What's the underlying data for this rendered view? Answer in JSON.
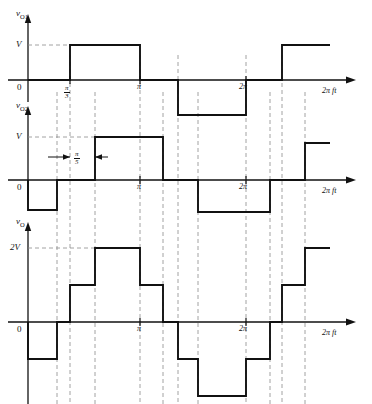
{
  "figure": {
    "stroke_color": "#111111",
    "dashed_color": "#808080",
    "background": "#ffffff",
    "axis_label": "2π ft",
    "zero_label": "0",
    "panels": [
      {
        "id": "vo1",
        "y_axis_label": "v",
        "y_axis_sub": "O1",
        "level_label": "V",
        "x_ticks": [
          {
            "label_type": "fraction",
            "num": "π",
            "den": "3",
            "x": 70
          },
          {
            "label_type": "plain",
            "label": "π",
            "x": 140
          },
          {
            "label_type": "plain",
            "label": "2π",
            "x": 246
          }
        ],
        "waveform": {
          "description": "square wave, 0 at start, +V from pi/3 to pi, -V from 1.27pi to 2pi region, +V again from 2.32pi",
          "segments": [
            {
              "x0": 28,
              "x1": 70,
              "level": 0
            },
            {
              "x0": 70,
              "x1": 140,
              "level": 1
            },
            {
              "x0": 140,
              "x1": 178,
              "level": 0
            },
            {
              "x0": 178,
              "x1": 246,
              "level": -1
            },
            {
              "x0": 246,
              "x1": 282,
              "level": 0
            },
            {
              "x0": 282,
              "x1": 330,
              "level": 1
            }
          ]
        }
      },
      {
        "id": "vo2",
        "y_axis_label": "v",
        "y_axis_sub": "O2",
        "level_label": "V",
        "phase_shift_label": {
          "label_type": "fraction",
          "num": "π",
          "den": "5"
        },
        "x_ticks": [
          {
            "label_type": "plain",
            "label": "π",
            "x": 140
          },
          {
            "label_type": "plain",
            "label": "2π",
            "x": 246
          }
        ],
        "waveform": {
          "description": "square wave shifted by pi/5 relative to vO1",
          "segments": [
            {
              "x0": 28,
              "x1": 57,
              "level": -1
            },
            {
              "x0": 57,
              "x1": 95,
              "level": 0
            },
            {
              "x0": 95,
              "x1": 163,
              "level": 1
            },
            {
              "x0": 163,
              "x1": 198,
              "level": 0
            },
            {
              "x0": 198,
              "x1": 270,
              "level": -1
            },
            {
              "x0": 270,
              "x1": 305,
              "level": 0
            },
            {
              "x0": 305,
              "x1": 330,
              "level": 1
            }
          ]
        }
      },
      {
        "id": "vo",
        "y_axis_label": "v",
        "y_axis_sub": "O",
        "level_label": "2V",
        "x_ticks": [
          {
            "label_type": "plain",
            "label": "π",
            "x": 140
          },
          {
            "label_type": "plain",
            "label": "2π",
            "x": 246
          }
        ],
        "waveform": {
          "description": "staircase sum of vO1 and vO2 with levels -2V, -V, 0, +V, +2V",
          "segments": [
            {
              "x0": 28,
              "x1": 57,
              "level": -1
            },
            {
              "x0": 57,
              "x1": 70,
              "level": 0
            },
            {
              "x0": 70,
              "x1": 95,
              "level": 1
            },
            {
              "x0": 95,
              "x1": 140,
              "level": 2
            },
            {
              "x0": 140,
              "x1": 163,
              "level": 1
            },
            {
              "x0": 163,
              "x1": 178,
              "level": 0
            },
            {
              "x0": 178,
              "x1": 198,
              "level": -1
            },
            {
              "x0": 198,
              "x1": 246,
              "level": -2
            },
            {
              "x0": 246,
              "x1": 270,
              "level": -1
            },
            {
              "x0": 270,
              "x1": 282,
              "level": 0
            },
            {
              "x0": 282,
              "x1": 305,
              "level": 1
            },
            {
              "x0": 305,
              "x1": 330,
              "level": 2
            }
          ]
        }
      }
    ],
    "guide_lines_x": [
      57,
      70,
      95,
      140,
      163,
      178,
      198,
      246,
      270,
      282,
      305
    ]
  }
}
